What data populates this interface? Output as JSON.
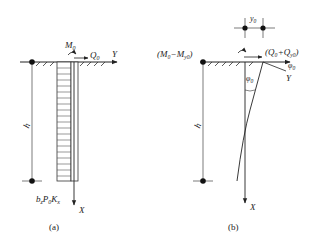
{
  "figure": {
    "panel_a": {
      "caption": "(a)",
      "moment_label": "M",
      "moment_sub": "0",
      "shear_label": "Q",
      "shear_sub": "0",
      "y_axis_label": "Y",
      "x_axis_label": "X",
      "depth_label": "h",
      "pressure_label_parts": [
        "b",
        "z",
        "P",
        "0",
        "K",
        "x"
      ]
    },
    "panel_b": {
      "caption": "(b)",
      "moment_label": "(M₀−M",
      "moment_sub": "y0",
      "moment_close": ")",
      "shear_label": "(Q₀+Q",
      "shear_sub": "y0",
      "shear_close": ")",
      "displacement_label": "y",
      "displacement_sub": "0",
      "rotation_label": "φ",
      "rotation_sub": "0",
      "y_axis_label": "Y",
      "x_axis_label": "X",
      "depth_label": "h"
    },
    "colors": {
      "line": "#222222",
      "hatch": "#555555"
    }
  }
}
